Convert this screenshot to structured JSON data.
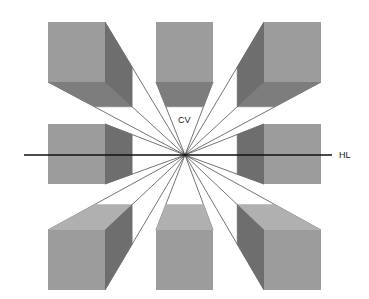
{
  "diagram": {
    "labels": {
      "vanishing_point": "CV",
      "horizon_line": "HL"
    },
    "colors": {
      "background": "#ffffff",
      "front_face": "#9c9c9c",
      "side_face": "#6e6e6e",
      "bottom_face": "#7d7d7d",
      "top_face": "#b0b0b0",
      "convergence_line": "#3a3a3a",
      "horizon_line": "#111111",
      "text": "#1a1a1a"
    },
    "vanishing_point": {
      "x": 185,
      "y": 155
    },
    "horizon_line": {
      "x1": 24,
      "x2": 332,
      "y": 155
    },
    "label_positions": {
      "cv": {
        "x": 178,
        "y": 123
      },
      "hl": {
        "x": 339,
        "y": 158
      }
    },
    "cubes": [
      {
        "id": "top-left",
        "row": "top",
        "col": "left",
        "front": {
          "x": 48,
          "y": 22,
          "w": 57,
          "h": 60
        },
        "side": "right",
        "horizontal_face": "bottom"
      },
      {
        "id": "top-center",
        "row": "top",
        "col": "center",
        "front": {
          "x": 156,
          "y": 22,
          "w": 57,
          "h": 60
        },
        "side": "none",
        "horizontal_face": "bottom"
      },
      {
        "id": "top-right",
        "row": "top",
        "col": "right",
        "front": {
          "x": 264,
          "y": 22,
          "w": 57,
          "h": 60
        },
        "side": "left",
        "horizontal_face": "bottom"
      },
      {
        "id": "middle-left",
        "row": "middle",
        "col": "left",
        "front": {
          "x": 48,
          "y": 124,
          "w": 57,
          "h": 60
        },
        "side": "right",
        "horizontal_face": "none"
      },
      {
        "id": "middle-right",
        "row": "middle",
        "col": "right",
        "front": {
          "x": 264,
          "y": 124,
          "w": 57,
          "h": 60
        },
        "side": "left",
        "horizontal_face": "none"
      },
      {
        "id": "bottom-left",
        "row": "bottom",
        "col": "left",
        "front": {
          "x": 48,
          "y": 230,
          "w": 57,
          "h": 60
        },
        "side": "right",
        "horizontal_face": "top"
      },
      {
        "id": "bottom-center",
        "row": "bottom",
        "col": "center",
        "front": {
          "x": 156,
          "y": 230,
          "w": 57,
          "h": 60
        },
        "side": "none",
        "horizontal_face": "top"
      },
      {
        "id": "bottom-right",
        "row": "bottom",
        "col": "right",
        "front": {
          "x": 264,
          "y": 230,
          "w": 57,
          "h": 60
        },
        "side": "left",
        "horizontal_face": "top"
      }
    ]
  }
}
